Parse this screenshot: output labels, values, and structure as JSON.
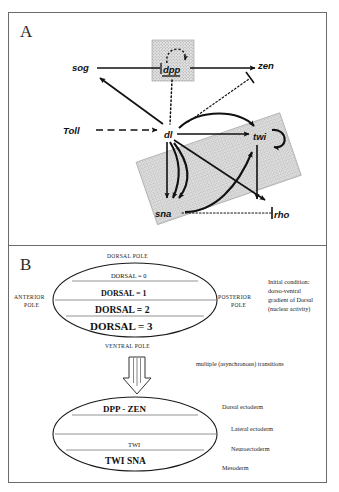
{
  "figure": {
    "panels": [
      {
        "letter": "A",
        "name": "regulatory-network"
      },
      {
        "letter": "B",
        "name": "dorsoventral-patterning"
      }
    ]
  },
  "panelA": {
    "letter": "A",
    "nodes": [
      {
        "id": "sog",
        "label": "sog",
        "x": 82,
        "y": 68
      },
      {
        "id": "dpp",
        "label": "dpp",
        "x": 172,
        "y": 70
      },
      {
        "id": "zen",
        "label": "zen",
        "x": 268,
        "y": 65
      },
      {
        "id": "Toll",
        "label": "Toll",
        "x": 78,
        "y": 131
      },
      {
        "id": "dl",
        "label": "dl",
        "x": 166,
        "y": 134
      },
      {
        "id": "twi",
        "label": "twi",
        "x": 261,
        "y": 137
      },
      {
        "id": "sna",
        "label": "sna",
        "x": 168,
        "y": 213
      },
      {
        "id": "rho",
        "label": "rho",
        "x": 281,
        "y": 215
      }
    ],
    "edges": [
      {
        "from": "dpp",
        "to": "sog",
        "type": "activation-solid"
      },
      {
        "from": "dpp",
        "to": "zen",
        "type": "activation-solid"
      },
      {
        "from": "dpp",
        "to": "dpp",
        "type": "self-loop-dotted"
      },
      {
        "from": "dpp",
        "to": "dl",
        "type": "dotted"
      },
      {
        "from": "Toll",
        "to": "dl",
        "type": "activation-dashed"
      },
      {
        "from": "dl",
        "to": "sog",
        "type": "activation-solid"
      },
      {
        "from": "dl",
        "to": "twi",
        "type": "activation-solid"
      },
      {
        "from": "dl",
        "to": "sna",
        "type": "activation-solid"
      },
      {
        "from": "dl",
        "to": "rho",
        "type": "activation-solid"
      },
      {
        "from": "twi",
        "to": "twi",
        "type": "self-loop-solid"
      },
      {
        "from": "twi",
        "to": "sna",
        "type": "activation-curved"
      },
      {
        "from": "twi",
        "to": "rho",
        "type": "activation-solid"
      },
      {
        "from": "sna",
        "to": "twi",
        "type": "activation-curved"
      },
      {
        "from": "sna",
        "to": "rho",
        "type": "inhibition-dotted"
      },
      {
        "from": "twi",
        "to": "zen",
        "type": "inhibition-dotted"
      }
    ],
    "shaded_regions": [
      {
        "name": "dpp-box",
        "shape": "rectangle"
      },
      {
        "name": "mesoderm-band",
        "shape": "rotated-parallelogram"
      }
    ]
  },
  "panelB": {
    "letter": "B",
    "upper_embryo": {
      "name": "initial-condition-embryo",
      "pole_top": "DORSAL POLE",
      "pole_bottom": "VENTRAL POLE",
      "pole_left": "ANTERIOR\nPOLE",
      "pole_left_line1": "ANTERIOR",
      "pole_left_line2": "POLE",
      "pole_right_line1": "POSTERIOR",
      "pole_right_line2": "POLE",
      "bands": [
        {
          "label": "DORSAL = 0",
          "level": 0
        },
        {
          "label": "DORSAL = 1",
          "level": 1
        },
        {
          "label": "DORSAL = 2",
          "level": 2
        },
        {
          "label": "DORSAL = 3",
          "level": 3
        }
      ]
    },
    "annotation": {
      "name": "initial-condition-note",
      "line1": "Initial condition:",
      "line2": "dorso-ventral",
      "line3": "gradient of Dorsal",
      "line4": "(nuclear activity)"
    },
    "transition": {
      "name": "transition-arrow",
      "caption": "multiple (asynchronous) transitions"
    },
    "lower_embryo": {
      "name": "final-state-embryo",
      "bands": [
        {
          "gene": "DPP - ZEN",
          "tissue": "Dorsal ectoderm"
        },
        {
          "gene": "",
          "tissue": "Lateral ectoderm"
        },
        {
          "gene": "TWI",
          "tissue": "Neuroectoderm"
        },
        {
          "gene": "TWI   SNA",
          "tissue": "Mesoderm"
        }
      ]
    }
  },
  "colors": {
    "frame": "#6b6b6b",
    "ink": "#111111",
    "stipple_fill": "#d6d6d6",
    "band_line": "#777777"
  }
}
